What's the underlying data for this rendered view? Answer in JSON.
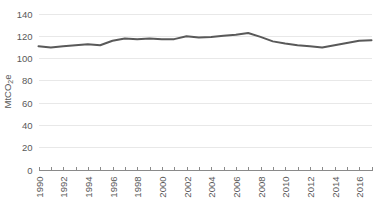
{
  "chart_data": {
    "type": "line",
    "title": "",
    "subtitle": "",
    "xlabel": "",
    "ylabel": "MtCO2e",
    "ylabel_parts": {
      "prefix": "MtCO",
      "subscript": "2",
      "suffix": "e"
    },
    "grid": true,
    "legend": "none",
    "xlim": [
      1990,
      2017
    ],
    "ylim": [
      0,
      140
    ],
    "y_ticks": [
      0,
      20,
      40,
      60,
      80,
      100,
      120,
      140
    ],
    "y_tick_labels": [
      "0",
      "20",
      "40",
      "60",
      "80",
      "100",
      "120",
      "140"
    ],
    "x_ticks": [
      1990,
      1991,
      1992,
      1993,
      1994,
      1995,
      1996,
      1997,
      1998,
      1999,
      2000,
      2001,
      2002,
      2003,
      2004,
      2005,
      2006,
      2007,
      2008,
      2009,
      2010,
      2011,
      2012,
      2013,
      2014,
      2015,
      2016,
      2017
    ],
    "x_tick_labels": [
      "1990",
      "",
      "1992",
      "",
      "1994",
      "",
      "1996",
      "",
      "1998",
      "",
      "2000",
      "",
      "2002",
      "",
      "2004",
      "",
      "2006",
      "",
      "2008",
      "",
      "2010",
      "",
      "2012",
      "",
      "2014",
      "",
      "2016",
      ""
    ],
    "x": [
      1990,
      1991,
      1992,
      1993,
      1994,
      1995,
      1996,
      1997,
      1998,
      1999,
      2000,
      2001,
      2002,
      2003,
      2004,
      2005,
      2006,
      2007,
      2008,
      2009,
      2010,
      2011,
      2012,
      2013,
      2014,
      2015,
      2016,
      2017
    ],
    "values": [
      110.5,
      109.5,
      110.5,
      111.5,
      112.5,
      111.5,
      115.5,
      117.5,
      117.0,
      117.5,
      117.0,
      117.0,
      119.5,
      118.5,
      119.0,
      120.0,
      121.0,
      122.5,
      119.0,
      115.0,
      113.0,
      111.5,
      110.5,
      109.5,
      111.5,
      113.5,
      115.5,
      116.0
    ],
    "series": [
      {
        "name": "Emissions",
        "color": "#595959",
        "values": [
          110.5,
          109.5,
          110.5,
          111.5,
          112.5,
          111.5,
          115.5,
          117.5,
          117.0,
          117.5,
          117.0,
          117.0,
          119.5,
          118.5,
          119.0,
          120.0,
          121.0,
          122.5,
          119.0,
          115.0,
          113.0,
          111.5,
          110.5,
          109.5,
          111.5,
          113.5,
          115.5,
          116.0
        ]
      }
    ],
    "colors": {
      "line": "#595959",
      "gridline": "#e8e8e8",
      "axis": "#8a8a8a",
      "text": "#595959",
      "background": "#ffffff"
    }
  }
}
